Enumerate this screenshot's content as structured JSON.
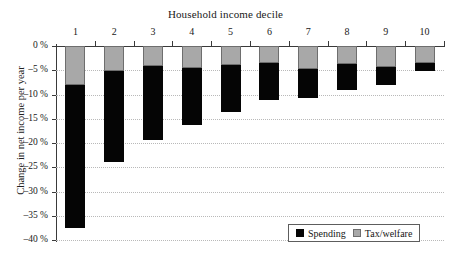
{
  "chart_data": {
    "type": "bar",
    "stacked": true,
    "title": "Household income decile",
    "subtitle": "",
    "xlabel": "Household income decile",
    "ylabel": "Change in net income per year",
    "categories": [
      "1",
      "2",
      "3",
      "4",
      "5",
      "6",
      "7",
      "8",
      "9",
      "10"
    ],
    "series": [
      {
        "name": "Tax/welfare",
        "color": "#a8a8a8",
        "values": [
          -8.0,
          -5.2,
          -4.2,
          -4.6,
          -3.9,
          -3.6,
          -4.7,
          -3.8,
          -4.4,
          -3.6
        ]
      },
      {
        "name": "Spending",
        "color": "#050505",
        "values": [
          -29.5,
          -18.7,
          -15.1,
          -11.7,
          -9.7,
          -7.6,
          -6.1,
          -5.2,
          -3.6,
          -1.6
        ]
      }
    ],
    "totals": [
      -37.5,
      -23.9,
      -19.3,
      -16.3,
      -13.6,
      -11.2,
      -10.8,
      -9.0,
      -8.0,
      -5.2
    ],
    "ylim": [
      -40,
      0
    ],
    "ytick_values": [
      0,
      -5,
      -10,
      -15,
      -20,
      -25,
      -30,
      -35,
      -40
    ],
    "ytick_labels": [
      "0 %",
      "–5 %",
      "–10 %",
      "–15 %",
      "–20 %",
      "–25 %",
      "–30 %",
      "–35 %",
      "–40 %"
    ],
    "grid": true,
    "grid_style": "dotted",
    "grid_color": "#b9b9b9",
    "legend_position": "bottom-right",
    "legend_entries": [
      "Spending",
      "Tax/welfare"
    ],
    "x_axis_position": "top",
    "background": "#ffffff",
    "axis_color": "#3a3a3a"
  }
}
